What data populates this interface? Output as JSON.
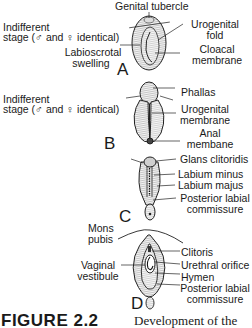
{
  "figure": {
    "panels": [
      {
        "letter": "A",
        "stage_note_line1": "Indifferent",
        "stage_note_line2": "stage (♂ and ♀ identical)",
        "labels": {
          "genital_tubercle": "Genital tubercle",
          "urogenital_fold_1": "Urogenital",
          "urogenital_fold_2": "fold",
          "labioscrotal_1": "Labioscrotal",
          "labioscrotal_2": "swelling",
          "cloacal_1": "Cloacal",
          "cloacal_2": "membrane"
        }
      },
      {
        "letter": "B",
        "stage_note_line1": "Indifferent",
        "stage_note_line2": "stage (♂ and ♀ identical)",
        "labels": {
          "phallas": "Phallas",
          "urogenital_membrane_1": "Urogenital",
          "urogenital_membrane_2": "membrane",
          "anal_1": "Anal",
          "anal_2": "membane"
        }
      },
      {
        "letter": "C",
        "labels": {
          "glans": "Glans clitoridis",
          "labium_minus": "Labium minus",
          "labium_majus": "Labium majus",
          "posterior_1": "Posterior labial",
          "posterior_2": "commissure"
        }
      },
      {
        "letter": "D",
        "labels": {
          "mons_1": "Mons",
          "mons_2": "pubis",
          "vestibule_1": "Vaginal",
          "vestibule_2": "vestibule",
          "clitoris": "Clitoris",
          "urethral": "Urethral orifice",
          "hymen": "Hymen",
          "posterior_1": "Posterior labial",
          "posterior_2": "commissure"
        }
      }
    ],
    "caption": {
      "label": "FIGURE 2.2",
      "text": "Development of the"
    }
  }
}
